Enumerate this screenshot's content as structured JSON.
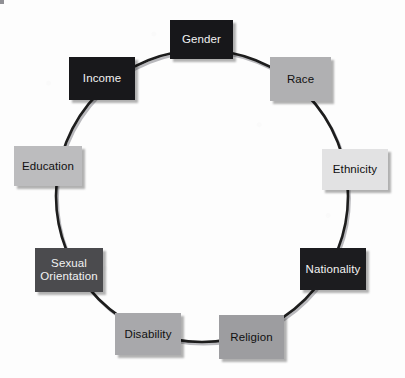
{
  "diagram": {
    "type": "circular-cycle",
    "background_color": "#fdfdfd",
    "ring": {
      "stroke_color": "#1d1d1d",
      "shadow_color": "#b9b9bd",
      "stroke_width": 2.6,
      "center_x": 202,
      "center_y": 196,
      "radius": 146
    },
    "nodes": [
      {
        "id": "gender",
        "label": "Gender",
        "fill": "#17171a",
        "text_color": "#f2f2f2",
        "x": 170,
        "y": 20,
        "width": 63,
        "height": 39,
        "font_size": 11.5
      },
      {
        "id": "race",
        "label": "Race",
        "fill": "#b0b0b2",
        "text_color": "#101010",
        "x": 270,
        "y": 57,
        "width": 61,
        "height": 44,
        "font_size": 11.5
      },
      {
        "id": "ethnicity",
        "label": "Ethnicity",
        "fill": "#e2e2e3",
        "text_color": "#101010",
        "x": 322,
        "y": 149,
        "width": 66,
        "height": 41,
        "font_size": 11.5
      },
      {
        "id": "nationality",
        "label": "Nationality",
        "fill": "#1c1c1f",
        "text_color": "#f2f2f2",
        "x": 300,
        "y": 248,
        "width": 66,
        "height": 42,
        "font_size": 11.5
      },
      {
        "id": "religion",
        "label": "Religion",
        "fill": "#9d9da0",
        "text_color": "#101010",
        "x": 219,
        "y": 315,
        "width": 65,
        "height": 44,
        "font_size": 11.5
      },
      {
        "id": "disability",
        "label": "Disability",
        "fill": "#a8a8ab",
        "text_color": "#101010",
        "x": 115,
        "y": 313,
        "width": 66,
        "height": 42,
        "font_size": 11.5
      },
      {
        "id": "sexual-orientation",
        "label": "Sexual\nOrientation",
        "fill": "#4b4b4e",
        "text_color": "#f2f2f2",
        "x": 35,
        "y": 248,
        "width": 68,
        "height": 44,
        "font_size": 11.5
      },
      {
        "id": "education",
        "label": "Education",
        "fill": "#bcbcbe",
        "text_color": "#101010",
        "x": 14,
        "y": 146,
        "width": 68,
        "height": 40,
        "font_size": 11.5
      },
      {
        "id": "income",
        "label": "Income",
        "fill": "#18181b",
        "text_color": "#f2f2f2",
        "x": 69,
        "y": 57,
        "width": 66,
        "height": 43,
        "font_size": 11.5
      }
    ]
  }
}
